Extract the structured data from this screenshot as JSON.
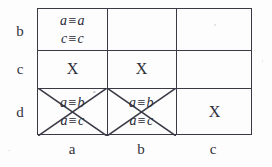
{
  "figure": {
    "kind": "congruence-matrix",
    "row_header_label": "rows",
    "col_header_label": "columns",
    "row_labels": [
      "b",
      "c",
      "d"
    ],
    "col_labels": [
      "a",
      "b",
      "c"
    ],
    "operator": "≡",
    "x_mark": "X",
    "cells": [
      [
        {
          "type": "equations",
          "lines": [
            "a ≡ a",
            "c ≡ c"
          ],
          "crossed": false
        },
        {
          "type": "empty",
          "lines": [],
          "crossed": false
        },
        {
          "type": "empty",
          "lines": [],
          "crossed": false
        }
      ],
      [
        {
          "type": "x",
          "lines": [
            "X"
          ],
          "crossed": false
        },
        {
          "type": "x",
          "lines": [
            "X"
          ],
          "crossed": false
        },
        {
          "type": "empty",
          "lines": [],
          "crossed": false
        }
      ],
      [
        {
          "type": "equations",
          "lines": [
            "a ≡ b",
            "a ≡ c"
          ],
          "crossed": true
        },
        {
          "type": "equations",
          "lines": [
            "a ≡ b",
            "a ≡ c"
          ],
          "crossed": true
        },
        {
          "type": "x",
          "lines": [
            "X"
          ],
          "crossed": false
        }
      ]
    ],
    "cell_text": {
      "r0c0_line1_left": "a",
      "r0c0_line1_right": "a",
      "r0c0_line2_left": "c",
      "r0c0_line2_right": "c",
      "r1c0": "X",
      "r1c1": "X",
      "r2c0_line1_left": "a",
      "r2c0_line1_right": "b",
      "r2c0_line2_left": "a",
      "r2c0_line2_right": "c",
      "r2c1_line1_left": "a",
      "r2c1_line1_right": "b",
      "r2c1_line2_left": "a",
      "r2c1_line2_right": "c",
      "r2c2": "X"
    },
    "marks": {
      "stray_tick": "u"
    },
    "colors": {
      "background": "#fdfdfd",
      "line": "#3a3a46",
      "text": "#2b2b38"
    }
  }
}
